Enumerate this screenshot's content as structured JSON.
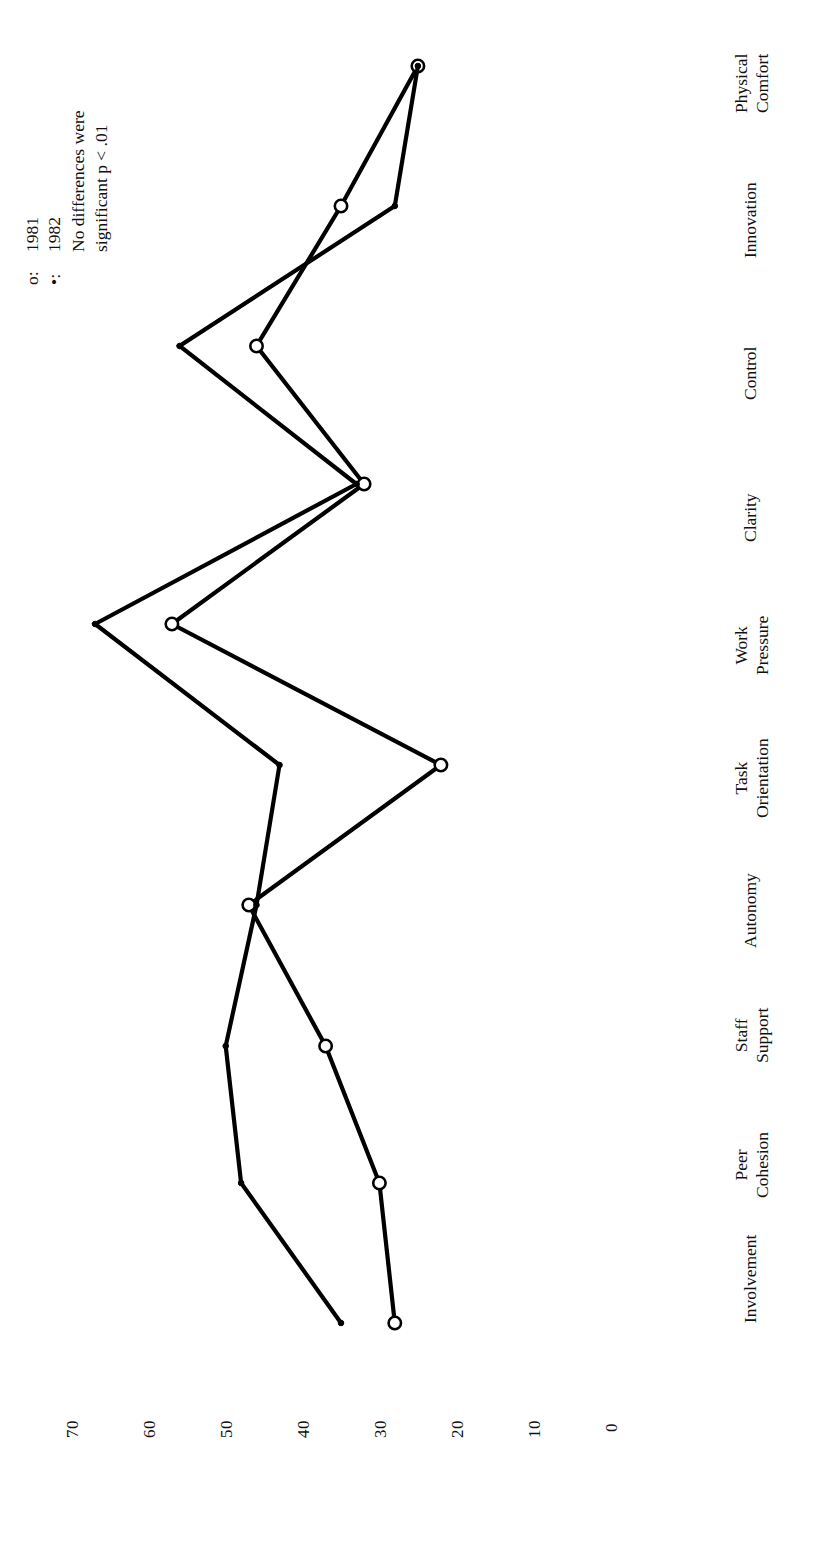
{
  "chart_data": {
    "type": "line",
    "title": "",
    "subtitle": "",
    "xlabel": "",
    "ylabel": "",
    "orientation": "rotated-90-ccw",
    "grid": false,
    "axis_ticks": [
      "70",
      "60",
      "50",
      "40",
      "30",
      "20",
      "10",
      "0"
    ],
    "ylim": [
      0,
      75
    ],
    "categories": [
      "Involvement",
      "Peer Cohesion",
      "Staff Support",
      "Autonomy",
      "Task Orientation",
      "Work Pressure",
      "Clarity",
      "Control",
      "Innovation",
      "Physical Comfort"
    ],
    "category_lines": [
      [
        "Involvement",
        ""
      ],
      [
        "Peer",
        "Cohesion"
      ],
      [
        "Staff",
        "Support"
      ],
      [
        "Autonomy",
        ""
      ],
      [
        "Task",
        "Orientation"
      ],
      [
        "Work",
        "Pressure"
      ],
      [
        "Clarity",
        ""
      ],
      [
        "Control",
        ""
      ],
      [
        "Innovation",
        ""
      ],
      [
        "Physical",
        "Comfort"
      ]
    ],
    "series": [
      {
        "name": "1981",
        "marker": "open-circle",
        "marker_glyph": "o",
        "values": [
          28,
          30,
          37,
          47,
          22,
          57,
          32,
          46,
          35,
          25
        ]
      },
      {
        "name": "1982",
        "marker": "filled-dot",
        "marker_glyph": "•",
        "values": [
          35,
          48,
          50,
          46,
          43,
          67,
          33,
          56,
          28,
          25
        ]
      }
    ],
    "legend": {
      "position": "top-left",
      "entries": [
        {
          "marker": "o:",
          "label": "1981"
        },
        {
          "marker": "•:",
          "label": "1982"
        }
      ],
      "note_line1": "No differences were",
      "note_line2": "significant p < .01"
    },
    "colors": {
      "ink": "#000000",
      "background": "#ffffff"
    }
  }
}
